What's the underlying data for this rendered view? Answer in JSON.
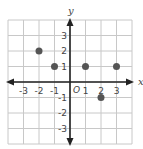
{
  "chart_data": {
    "type": "scatter",
    "title": "",
    "xlabel": "x",
    "ylabel": "y",
    "origin_label": "O",
    "xlim": [
      -4,
      4
    ],
    "ylim": [
      -4,
      4
    ],
    "grid": true,
    "x_ticks": [
      "-3",
      "-2",
      "-1",
      "1",
      "2",
      "3"
    ],
    "y_ticks": [
      "3",
      "2",
      "1",
      "-1",
      "-2",
      "-3"
    ],
    "points": [
      {
        "x": -2,
        "y": 2
      },
      {
        "x": -1,
        "y": 1
      },
      {
        "x": 1,
        "y": 1
      },
      {
        "x": 3,
        "y": 1
      },
      {
        "x": 2,
        "y": -1
      }
    ],
    "colors": {
      "grid": "#c8c8c8",
      "axis": "#222222",
      "point": "#555555"
    }
  }
}
